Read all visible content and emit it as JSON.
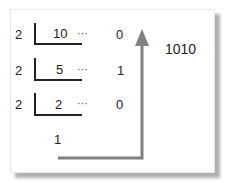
{
  "diagram": {
    "rows": [
      {
        "divisor": "2",
        "dividend": "10",
        "dots": "···",
        "remainder": "0"
      },
      {
        "divisor": "2",
        "dividend": "5",
        "dots": "···",
        "remainder": "1"
      },
      {
        "divisor": "2",
        "dividend": "2",
        "dots": "···",
        "remainder": "0"
      }
    ],
    "final_quotient": "1",
    "result": "1010",
    "arrow_color": "#808080"
  }
}
